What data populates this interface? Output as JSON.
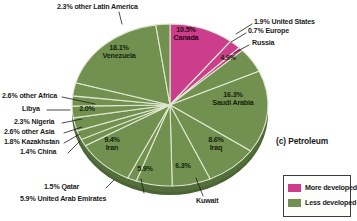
{
  "caption": "(c) Petroleum",
  "colors": {
    "more_developed": "#cc3d8b",
    "more_developed_side": "#9c2566",
    "less_developed": "#72904f",
    "less_developed_side": "#4a6434",
    "separator": "#dfe8d2",
    "background": "#ffffff",
    "text": "#1c1c1c"
  },
  "legend": {
    "items": [
      {
        "label": "More developed",
        "color": "#cc3d8b"
      },
      {
        "label": "Less developed",
        "color": "#72904f"
      }
    ]
  },
  "chart_data": {
    "type": "pie",
    "title": "(c) Petroleum",
    "subtitle": "",
    "xlabel": "",
    "ylabel": "",
    "units": "percent",
    "legend_position": "bottom-right",
    "start_angle_deg": 0,
    "direction": "clockwise",
    "categories": [
      "Canada",
      "United States",
      "Europe",
      "Russia",
      "Saudi Arabia",
      "Iraq",
      "Kuwait",
      "United Arab Emirates",
      "Qatar",
      "Iran",
      "China",
      "Kazakhstan",
      "other Asia",
      "Nigeria",
      "Libya",
      "other Africa",
      "Venezuela",
      "other Latin America"
    ],
    "values": [
      10.5,
      1.9,
      0.7,
      4.9,
      16.3,
      8.6,
      6.3,
      5.9,
      1.5,
      9.4,
      1.4,
      1.8,
      2.6,
      2.3,
      2.0,
      2.6,
      18.1,
      2.3
    ],
    "groups": [
      "More developed",
      "More developed",
      "More developed",
      "Less developed",
      "Less developed",
      "Less developed",
      "Less developed",
      "Less developed",
      "Less developed",
      "Less developed",
      "Less developed",
      "Less developed",
      "Less developed",
      "Less developed",
      "Less developed",
      "Less developed",
      "Less developed",
      "Less developed"
    ],
    "series": [
      {
        "name": "Share of world petroleum reserves",
        "values": [
          10.5,
          1.9,
          0.7,
          4.9,
          16.3,
          8.6,
          6.3,
          5.9,
          1.5,
          9.4,
          1.4,
          1.8,
          2.6,
          2.3,
          2.0,
          2.6,
          18.1,
          2.3
        ]
      }
    ]
  },
  "slice_labels": {
    "canada": {
      "pct": "10.5%",
      "name": "Canada"
    },
    "united_states": {
      "pct": "1.9%",
      "name": "United States"
    },
    "europe": {
      "pct": "0.7%",
      "name": "Europe"
    },
    "russia_name": {
      "name": "Russia"
    },
    "russia_pct": {
      "pct": "4.9%"
    },
    "saudi_arabia": {
      "pct": "16.3%",
      "name": "Saudi Arabia"
    },
    "iraq": {
      "pct": "8.6%",
      "name": "Iraq"
    },
    "kuwait_pct": {
      "pct": "6.3%"
    },
    "kuwait_name": {
      "name": "Kuwait"
    },
    "uae_pct": {
      "pct": "5.9%"
    },
    "uae": {
      "pct": "5.9%",
      "name": "United Arab Emirates"
    },
    "qatar": {
      "pct": "1.5%",
      "name": "Qatar"
    },
    "iran": {
      "pct": "9.4%",
      "name": "Iran"
    },
    "china": {
      "pct": "1.4%",
      "name": "China"
    },
    "kazakhstan": {
      "pct": "1.8%",
      "name": "Kazakhstan"
    },
    "other_asia": {
      "pct": "2.6%",
      "name": "other Asia"
    },
    "nigeria": {
      "pct": "2.3%",
      "name": "Nigeria"
    },
    "libya_name": {
      "name": "Libya"
    },
    "libya_pct": {
      "pct": "2.0%"
    },
    "other_africa": {
      "pct": "2.6%",
      "name": "other Africa"
    },
    "venezuela": {
      "pct": "18.1%",
      "name": "Venezuela"
    },
    "other_latin": {
      "pct": "2.3%",
      "name": "other Latin America"
    }
  }
}
